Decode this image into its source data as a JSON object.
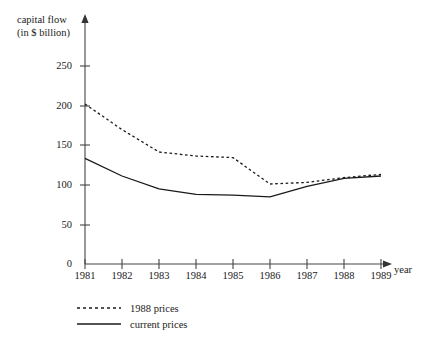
{
  "chart_data": {
    "type": "line",
    "title": "",
    "ylabel": "capital flow\n(in $ billion)",
    "ylabel_line1": "capital flow",
    "ylabel_line2": "(in $ billion)",
    "xlabel": "year",
    "categories": [
      "1981",
      "1982",
      "1983",
      "1984",
      "1985",
      "1986",
      "1987",
      "1988",
      "1989"
    ],
    "x": [
      1981,
      1982,
      1983,
      1984,
      1985,
      1986,
      1987,
      1988,
      1989
    ],
    "ylim": [
      0,
      270
    ],
    "y_ticks": [
      0,
      50,
      100,
      150,
      200,
      250
    ],
    "y_tick_labels": [
      "0",
      "50",
      "100",
      "150",
      "200",
      "250"
    ],
    "grid": false,
    "legend_position": "below-left",
    "series": [
      {
        "name": "1988 prices",
        "style": "dashed",
        "color": "#1a1a1a",
        "values": [
          200,
          168,
          140,
          135,
          133,
          100,
          102,
          108,
          112
        ]
      },
      {
        "name": "current prices",
        "style": "solid",
        "color": "#1a1a1a",
        "values": [
          132,
          110,
          94,
          87,
          86,
          84,
          97,
          107,
          110
        ]
      }
    ]
  },
  "legend": {
    "items": [
      {
        "label": "1988 prices",
        "style": "dashed"
      },
      {
        "label": "current prices",
        "style": "solid"
      }
    ]
  },
  "axes": {
    "y_label_line1": "capital flow",
    "y_label_line2": "(in $ billion)",
    "x_label": "year"
  }
}
